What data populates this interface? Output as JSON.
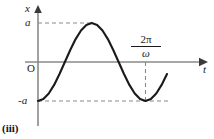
{
  "figure": {
    "number_label": "(iii)",
    "axes": {
      "y_axis_label": "x",
      "x_axis_label": "t",
      "origin_label": "O",
      "amplitude_positive_label": "a",
      "amplitude_negative_label": "-a"
    },
    "annotations": {
      "period_numerator": "2π",
      "period_denominator": "ω"
    },
    "colors": {
      "curve": "#1a1a1a",
      "axis": "#7d7d7d",
      "guide_dash": "#8a8a8a",
      "text": "#1a1a1a",
      "background": "#ffffff"
    }
  },
  "chart_data": {
    "type": "line",
    "title": "",
    "xlabel": "t",
    "ylabel": "x",
    "grid": false,
    "legend": null,
    "equation": "x = -a cos(ω t)",
    "xlim": [
      0,
      1.28
    ],
    "ylim": [
      -1.25,
      1.25
    ],
    "x_tick_labels": [
      "2π/ω"
    ],
    "x_tick_values": [
      1.0
    ],
    "y_tick_labels": [
      "a",
      "-a"
    ],
    "y_tick_values": [
      1.0,
      -1.0
    ],
    "guides": [
      {
        "type": "hline",
        "value": 1.0,
        "label": "a",
        "style": "dashed",
        "x_from": 0.0,
        "x_to": 0.5
      },
      {
        "type": "hline",
        "value": -1.0,
        "label": "-a",
        "style": "dashed",
        "x_from": 0.0,
        "x_to": 1.23
      },
      {
        "type": "vline",
        "value": 1.0,
        "label": "2π/ω",
        "style": "dashed",
        "y_from": -1.0,
        "y_to": 0.0
      }
    ],
    "series": [
      {
        "name": "x(t)",
        "x": [
          0.0,
          0.05,
          0.1,
          0.15,
          0.2,
          0.25,
          0.3,
          0.35,
          0.4,
          0.45,
          0.5,
          0.55,
          0.6,
          0.65,
          0.7,
          0.75,
          0.8,
          0.85,
          0.9,
          0.95,
          1.0,
          1.05,
          1.1,
          1.15,
          1.2
        ],
        "y": [
          -1.0,
          -0.951,
          -0.809,
          -0.588,
          -0.309,
          0.0,
          0.309,
          0.588,
          0.809,
          0.951,
          1.0,
          0.951,
          0.809,
          0.588,
          0.309,
          0.0,
          -0.309,
          -0.588,
          -0.809,
          -0.951,
          -1.0,
          -0.951,
          -0.809,
          -0.588,
          -0.309
        ]
      }
    ]
  }
}
